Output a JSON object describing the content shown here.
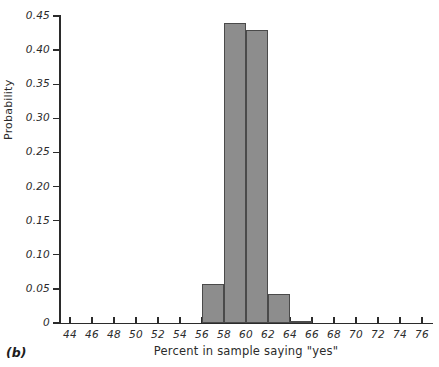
{
  "figure": {
    "panel_tag": "(b)",
    "width": 439,
    "height": 367
  },
  "chart_data": {
    "type": "bar",
    "title": "",
    "subtitle": "",
    "xlabel": "Percent in sample saying \"yes\"",
    "ylabel": "Probability",
    "xlim": [
      43,
      77
    ],
    "ylim": [
      0,
      0.45
    ],
    "grid": false,
    "legend": null,
    "bin_width": 2,
    "bar_color": "#8d8d8d",
    "bar_edge_color": "#4a4a4a",
    "axis_color": "#2b2b2b",
    "xticks": [
      44,
      46,
      48,
      50,
      52,
      54,
      56,
      58,
      60,
      62,
      64,
      66,
      68,
      70,
      72,
      74,
      76
    ],
    "xtick_labels": [
      "44",
      "46",
      "48",
      "50",
      "52",
      "54",
      "56",
      "58",
      "60",
      "62",
      "64",
      "66",
      "68",
      "70",
      "72",
      "74",
      "76"
    ],
    "yticks": [
      0,
      0.05,
      0.1,
      0.15,
      0.2,
      0.25,
      0.3,
      0.35,
      0.4,
      0.45
    ],
    "ytick_labels": [
      "0",
      "0.05",
      "0.10",
      "0.15",
      "0.20",
      "0.25",
      "0.30",
      "0.35",
      "0.40",
      "0.45"
    ],
    "bins": [
      {
        "x0": 56,
        "x1": 58,
        "value": 0.057
      },
      {
        "x0": 58,
        "x1": 60,
        "value": 0.44
      },
      {
        "x0": 60,
        "x1": 62,
        "value": 0.43
      },
      {
        "x0": 62,
        "x1": 64,
        "value": 0.042
      },
      {
        "x0": 64,
        "x1": 66,
        "value": 0.003
      }
    ],
    "categories": [
      "56-58",
      "58-60",
      "60-62",
      "62-64",
      "64-66"
    ],
    "values": [
      0.057,
      0.44,
      0.43,
      0.042,
      0.003
    ]
  }
}
